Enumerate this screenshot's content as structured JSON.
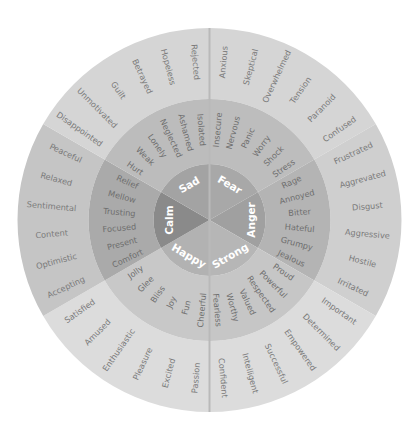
{
  "center": {
    "x": 209.5,
    "y": 220
  },
  "radii": {
    "core": 56,
    "middle": 121,
    "outer": 192
  },
  "divider_color": "#b9b9b9",
  "sectors": [
    {
      "name": "Fear",
      "start": 270,
      "end": 330,
      "colors": {
        "core": "#a8a8a8",
        "middle": "#bdbdbd",
        "outer": "#d5d5d5"
      },
      "middle": [
        "Insecure",
        "Nervous",
        "Panic",
        "Worry",
        "Shock",
        "Stress"
      ],
      "outer": [
        "Anxious",
        "Skeptical",
        "Overwhelmed",
        "Tension",
        "Paranoid",
        "Confused"
      ]
    },
    {
      "name": "Anger",
      "start": 330,
      "end": 390,
      "colors": {
        "core": "#a0a0a0",
        "middle": "#b4b4b4",
        "outer": "#cfcfcf"
      },
      "middle": [
        "Rage",
        "Annoyed",
        "Bitter",
        "Hateful",
        "Grumpy",
        "Jealous"
      ],
      "outer": [
        "Frustrated",
        "Aggrevated",
        "Disgust",
        "Aggressive",
        "Hostile",
        "Irritated"
      ]
    },
    {
      "name": "Strong",
      "start": 30,
      "end": 90,
      "colors": {
        "core": "#b6b6b6",
        "middle": "#c6c6c6",
        "outer": "#dcdcdc"
      },
      "middle": [
        "Proud",
        "Powerful",
        "Respected",
        "Valued",
        "Worthy",
        "Fearless"
      ],
      "outer": [
        "Important",
        "Determined",
        "Empowered",
        "Successful",
        "Intelligent",
        "Confident"
      ]
    },
    {
      "name": "Happy",
      "start": 90,
      "end": 150,
      "colors": {
        "core": "#b2b2b2",
        "middle": "#c8c8c8",
        "outer": "#dcdcdc"
      },
      "middle": [
        "Cheerful",
        "Fun",
        "Joy",
        "Bliss",
        "Glee",
        "Jolly"
      ],
      "outer": [
        "Passion",
        "Excited",
        "Pleasure",
        "Enthusiastic",
        "Amused",
        "Satisfied"
      ]
    },
    {
      "name": "Calm",
      "start": 150,
      "end": 210,
      "colors": {
        "core": "#8a8a8a",
        "middle": "#aaaaaa",
        "outer": "#c5c5c5"
      },
      "middle": [
        "Comfort",
        "Present",
        "Focused",
        "Trusting",
        "Mellow",
        "Relief"
      ],
      "outer": [
        "Accepting",
        "Optimistic",
        "Content",
        "Sentimental",
        "Relaxed",
        "Peaceful"
      ]
    },
    {
      "name": "Sad",
      "start": 210,
      "end": 270,
      "colors": {
        "core": "#a3a3a3",
        "middle": "#bcbcbc",
        "outer": "#d5d5d5"
      },
      "middle": [
        "Hurt",
        "Weak",
        "Lonely",
        "Neglected",
        "Ashamed",
        "Isolated"
      ],
      "outer": [
        "Disappointed",
        "Unmotivated",
        "Guilt",
        "Betrayed",
        "Hopeless",
        "Rejected"
      ]
    }
  ]
}
